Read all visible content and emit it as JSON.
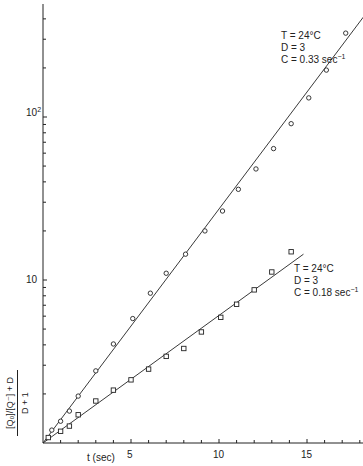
{
  "chart_data": {
    "type": "scatter",
    "title": "",
    "xlabel": "t (sec)",
    "ylabel": "([Q0]/[Q-] + D) / (D + 1)",
    "ylabel_parts": {
      "numerator": "[Q₀]/[Q⁻] + D",
      "denominator": "D + 1"
    },
    "x_scale": "linear",
    "y_scale": "log",
    "xlim": [
      0,
      18
    ],
    "ylim": [
      1,
      500
    ],
    "x_ticks": [
      5,
      10,
      15
    ],
    "y_tick_labels": [
      "10",
      "10²"
    ],
    "y_ticks": [
      10,
      100
    ],
    "grid": false,
    "series": [
      {
        "name": "T = 24°C, D = 3, C = 0.33 sec⁻¹",
        "marker": "circle",
        "fit_line": {
          "from": [
            0,
            1
          ],
          "to": [
            18.2,
            410
          ]
        },
        "x": [
          0.5,
          1.0,
          1.5,
          2.0,
          3.0,
          4.0,
          5.1,
          6.1,
          7.0,
          8.1,
          9.2,
          10.2,
          11.1,
          12.1,
          13.1,
          14.1,
          15.1,
          16.1,
          17.2
        ],
        "y": [
          1.2,
          1.36,
          1.57,
          1.94,
          2.77,
          4.05,
          5.8,
          8.3,
          11,
          14.4,
          20,
          26.5,
          36,
          48,
          64,
          91,
          131,
          194,
          327
        ]
      },
      {
        "name": "T = 24°C, D = 3, C = 0.18 sec⁻¹",
        "marker": "square",
        "fit_line": {
          "from": [
            0,
            1
          ],
          "to": [
            14.8,
            14.4
          ]
        },
        "x": [
          0.3,
          1.0,
          1.5,
          2.0,
          3.0,
          4.0,
          5.0,
          6.0,
          7.0,
          8.0,
          9.0,
          10.1,
          11.0,
          12.0,
          13.0,
          14.1
        ],
        "y": [
          1.08,
          1.18,
          1.27,
          1.49,
          1.81,
          2.11,
          2.44,
          2.84,
          3.4,
          3.8,
          4.8,
          5.9,
          7.1,
          8.7,
          11.2,
          14.9
        ]
      }
    ],
    "annotations": [
      {
        "lines": [
          "T = 24°C",
          "D = 3",
          "C = 0.33 sec"
        ],
        "sup": "−1"
      },
      {
        "lines": [
          "T = 24°C",
          "D = 3",
          "C = 0.18 sec"
        ],
        "sup": "−1"
      }
    ]
  },
  "labels": {
    "xlabel": "t (sec)",
    "x5": "5",
    "x10": "10",
    "x15": "15",
    "y10": "10",
    "y100_base": "10",
    "y100_exp": "2",
    "ylab_num": "[Q₀]/[Q⁻] + D",
    "ylab_den": "D + 1",
    "ann1_l1": "T = 24°C",
    "ann1_l2": "D = 3",
    "ann1_l3": "C = 0.33 sec",
    "ann1_sup": "−1",
    "ann2_l1": "T = 24°C",
    "ann2_l2": "D = 3",
    "ann2_l3": "C = 0.18 sec",
    "ann2_sup": "−1"
  }
}
